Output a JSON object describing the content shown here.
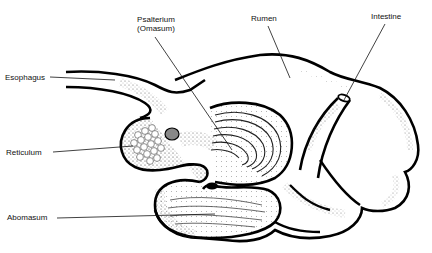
{
  "diagram": {
    "labels": {
      "esophagus": "Esophagus",
      "psalterium_line1": "Psalterium",
      "psalterium_line2": "(Omasum)",
      "rumen": "Rumen",
      "intestine": "Intestine",
      "reticulum": "Reticulum",
      "abomasum": "Abomasum"
    },
    "colors": {
      "outline": "#000000",
      "stipple": "#555555",
      "background": "#ffffff"
    }
  }
}
